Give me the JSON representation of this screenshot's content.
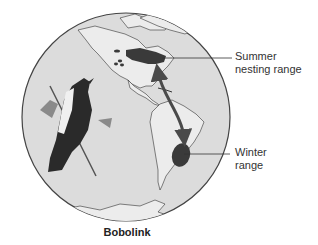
{
  "figure": {
    "title": "Bobolink",
    "labels": {
      "summer": [
        "Summer",
        "nesting range"
      ],
      "winter": [
        "Winter",
        "range"
      ]
    },
    "colors": {
      "globe_fill": "#dcdcdc",
      "globe_outline": "#444444",
      "land_fill": "#ececec",
      "range_fill": "#3a3a3a",
      "arrow": "#4a4a4a",
      "leader_line": "#333333"
    }
  }
}
